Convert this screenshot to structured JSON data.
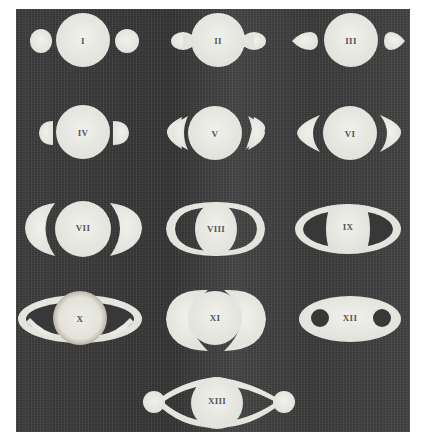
{
  "figure": {
    "background_color": "#3a3a3a",
    "shape_color": "#ebebe6",
    "figures": [
      {
        "id": 1,
        "label": "I"
      },
      {
        "id": 2,
        "label": "II"
      },
      {
        "id": 3,
        "label": "III"
      },
      {
        "id": 4,
        "label": "IV"
      },
      {
        "id": 5,
        "label": "V"
      },
      {
        "id": 6,
        "label": "VI"
      },
      {
        "id": 7,
        "label": "VII"
      },
      {
        "id": 8,
        "label": "VIII"
      },
      {
        "id": 9,
        "label": "IX"
      },
      {
        "id": 10,
        "label": "X"
      },
      {
        "id": 11,
        "label": "XI"
      },
      {
        "id": 12,
        "label": "XII"
      },
      {
        "id": 13,
        "label": "XIII"
      }
    ]
  }
}
